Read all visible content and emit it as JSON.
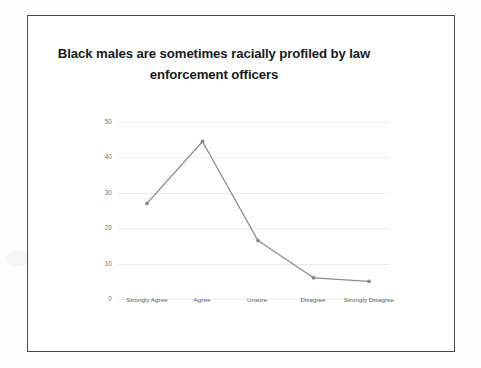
{
  "chart_data": {
    "type": "line",
    "title": "Black males are sometimes racially profiled by law enforcement officers",
    "categories": [
      "Strongly Agree",
      "Agree",
      "Unsure",
      "Disagree",
      "Strongly Disagree"
    ],
    "values": [
      27,
      44.5,
      16.5,
      6,
      5
    ],
    "xlabel": "",
    "ylabel": "",
    "ylim": [
      0,
      50
    ],
    "yticks": [
      0,
      10,
      20,
      30,
      40,
      50
    ],
    "ytick_labels": [
      "0",
      "10",
      "20",
      "30",
      "40",
      "50"
    ],
    "grid": true,
    "legend": false,
    "series": [
      {
        "name": "Responses",
        "values": [
          27,
          44.5,
          16.5,
          6,
          5
        ],
        "color": "#8b8b8b",
        "marker": "circle"
      }
    ]
  },
  "colors": {
    "line": "#8b8b8b",
    "grid": "#ececec",
    "frame": "#4a4a4a",
    "title_text": "#1b1b1b",
    "tick_text": "#6f6f6f",
    "background": "#ffffff"
  }
}
